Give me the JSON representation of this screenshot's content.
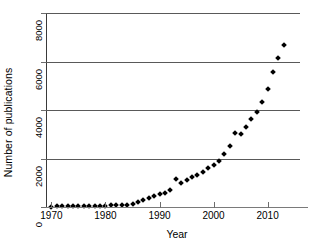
{
  "chart_data": {
    "type": "scatter",
    "title": "",
    "xlabel": "Year",
    "ylabel": "Number of publications",
    "xlim": [
      1969,
      2016
    ],
    "ylim": [
      0,
      8000
    ],
    "grid": true,
    "legend": null,
    "xticks": [
      1970,
      1980,
      1990,
      2000,
      2010
    ],
    "xtick_labels": [
      "1970",
      "1980",
      "1990",
      "2000",
      "2010"
    ],
    "yticks": [
      0,
      2000,
      4000,
      6000,
      8000
    ],
    "ytick_labels": [
      "0",
      "2000",
      "4000",
      "6000",
      "8000"
    ],
    "marker": "diamond",
    "marker_color": "#000000",
    "x": [
      1970,
      1971,
      1972,
      1973,
      1974,
      1975,
      1976,
      1977,
      1978,
      1979,
      1980,
      1981,
      1982,
      1983,
      1984,
      1985,
      1986,
      1987,
      1988,
      1989,
      1990,
      1991,
      1992,
      1993,
      1994,
      1995,
      1996,
      1997,
      1998,
      1999,
      2000,
      2001,
      2002,
      2003,
      2004,
      2005,
      2006,
      2007,
      2008,
      2009,
      2010,
      2011,
      2012,
      2013
    ],
    "y": [
      20,
      25,
      30,
      30,
      35,
      40,
      45,
      50,
      50,
      55,
      60,
      65,
      70,
      80,
      95,
      130,
      200,
      290,
      380,
      450,
      520,
      560,
      700,
      1150,
      1000,
      1120,
      1230,
      1330,
      1450,
      1600,
      1750,
      1900,
      2200,
      2500,
      3050,
      3020,
      3300,
      3620,
      3900,
      4320,
      4880,
      5570,
      6150,
      6700
    ],
    "series": [
      {
        "name": "publications",
        "values": [
          20,
          25,
          30,
          30,
          35,
          40,
          45,
          50,
          50,
          55,
          60,
          65,
          70,
          80,
          95,
          130,
          200,
          290,
          380,
          450,
          520,
          560,
          700,
          1150,
          1000,
          1120,
          1230,
          1330,
          1450,
          1600,
          1750,
          1900,
          2200,
          2500,
          3050,
          3020,
          3300,
          3620,
          3900,
          4320,
          4880,
          5570,
          6150,
          6700
        ]
      }
    ]
  }
}
